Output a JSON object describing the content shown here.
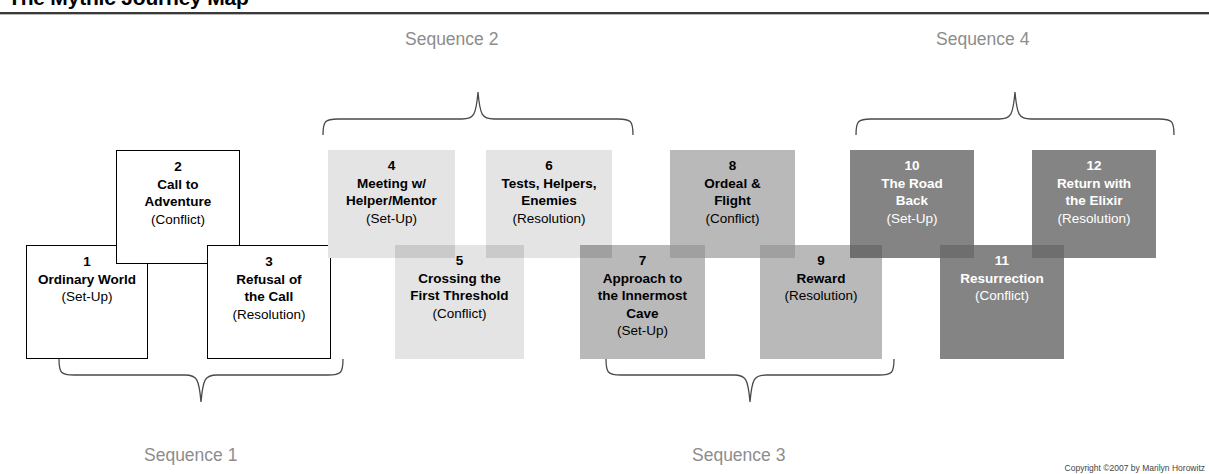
{
  "header": {
    "title": "The Mythic Journey Map"
  },
  "sequences": [
    {
      "label": "Sequence 1",
      "position": "below"
    },
    {
      "label": "Sequence 2",
      "position": "above"
    },
    {
      "label": "Sequence 3",
      "position": "below"
    },
    {
      "label": "Sequence 4",
      "position": "above"
    }
  ],
  "stages": [
    {
      "number": "1",
      "name": "Ordinary World",
      "name2": "",
      "function": "(Set-Up)"
    },
    {
      "number": "2",
      "name": "Call to",
      "name2": "Adventure",
      "function": "(Conflict)"
    },
    {
      "number": "3",
      "name": "Refusal of",
      "name2": "the Call",
      "function": "(Resolution)"
    },
    {
      "number": "4",
      "name": "Meeting w/",
      "name2": "Helper/Mentor",
      "function": "(Set-Up)"
    },
    {
      "number": "5",
      "name": "Crossing the",
      "name2": "First Threshold",
      "function": "(Conflict)"
    },
    {
      "number": "6",
      "name": "Tests, Helpers,",
      "name2": "Enemies",
      "function": "(Resolution)"
    },
    {
      "number": "7",
      "name": "Approach to",
      "name2": "the Innermost|Cave",
      "function": "(Set-Up)"
    },
    {
      "number": "8",
      "name": "Ordeal &",
      "name2": "Flight",
      "function": "(Conflict)"
    },
    {
      "number": "9",
      "name": "Reward",
      "name2": "",
      "function": "(Resolution)"
    },
    {
      "number": "10",
      "name": "The Road",
      "name2": "Back",
      "function": "(Set-Up)"
    },
    {
      "number": "11",
      "name": "Resurrection",
      "name2": "",
      "function": "(Conflict)"
    },
    {
      "number": "12",
      "name": "Return with",
      "name2": "the Elixir",
      "function": "(Resolution)"
    }
  ],
  "colors": {
    "group1": "#ffffff",
    "group2": "#e4e4e4",
    "group3": "#b9b9b9",
    "group4": "#848484",
    "sequence_label": "#8d8d8d",
    "outline": "#000000"
  },
  "footer": {
    "copyright": "Copyright ©2007 by Marilyn Horowitz"
  }
}
